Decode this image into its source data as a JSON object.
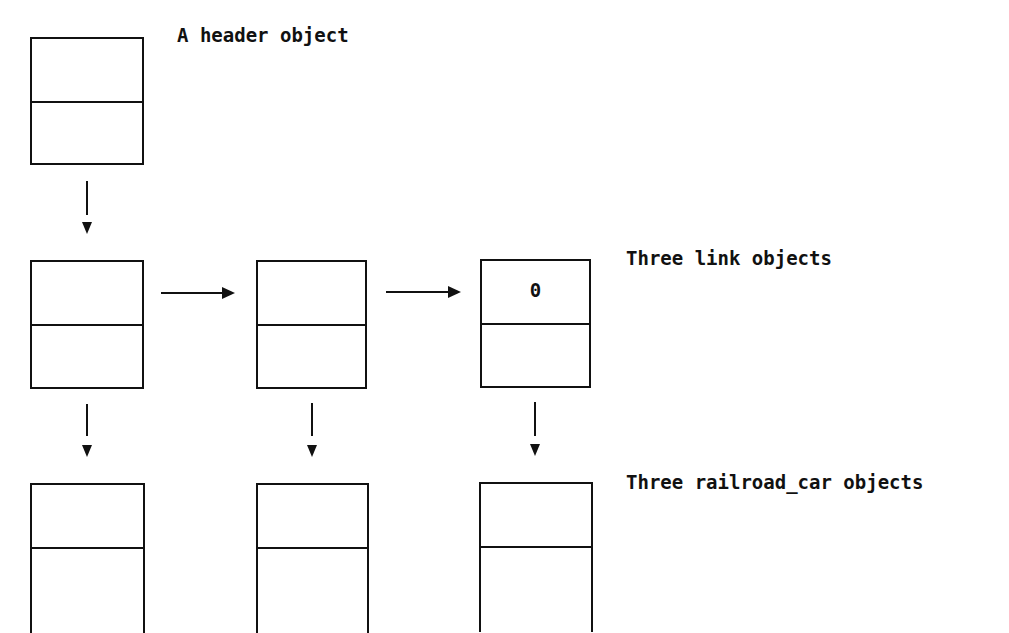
{
  "diagram": {
    "labels": {
      "header": "A header object",
      "links": "Three link objects",
      "cars": "Three railroad_car objects"
    },
    "header_object": {
      "top_value": "",
      "bottom_value": ""
    },
    "link_objects": [
      {
        "top_value": "",
        "bottom_value": ""
      },
      {
        "top_value": "",
        "bottom_value": ""
      },
      {
        "top_value": "0",
        "bottom_value": ""
      }
    ],
    "railroad_car_objects": [
      {
        "top_value": ""
      },
      {
        "top_value": ""
      },
      {
        "top_value": ""
      }
    ],
    "arrows": [
      {
        "from": "header",
        "to": "link-1",
        "direction": "down"
      },
      {
        "from": "link-1",
        "to": "link-2",
        "direction": "right"
      },
      {
        "from": "link-2",
        "to": "link-3",
        "direction": "right"
      },
      {
        "from": "link-1",
        "to": "car-1",
        "direction": "down"
      },
      {
        "from": "link-2",
        "to": "car-2",
        "direction": "down"
      },
      {
        "from": "link-3",
        "to": "car-3",
        "direction": "down"
      }
    ]
  }
}
